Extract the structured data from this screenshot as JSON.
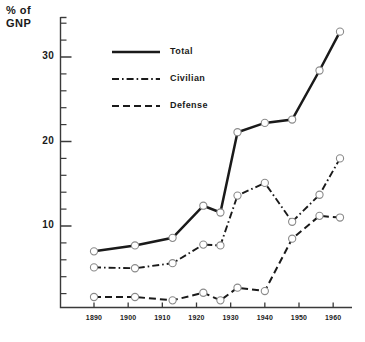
{
  "chart_data": {
    "type": "line",
    "title": "",
    "xlabel": "",
    "ylabel": "% of\nGNP",
    "ylabel_line1": "% of",
    "ylabel_line2": "GNP",
    "x": [
      1890,
      1902,
      1913,
      1922,
      1927,
      1932,
      1940,
      1948,
      1956,
      1962
    ],
    "xtick_labels": [
      "1890",
      "1900",
      "1910",
      "1920",
      "1930",
      "1940",
      "1950",
      "1960"
    ],
    "xtick_values": [
      1890,
      1900,
      1910,
      1920,
      1930,
      1940,
      1950,
      1960
    ],
    "ytick_labels": [
      "10",
      "20",
      "30"
    ],
    "ytick_values": [
      10,
      20,
      30
    ],
    "yminor_step": 2,
    "xlim": [
      1884,
      1966
    ],
    "ylim": [
      0,
      34.5
    ],
    "grid": false,
    "legend_position": "upper-left-inside",
    "marker": "open-circle",
    "series": [
      {
        "name": "Total",
        "style": "solid",
        "values": [
          7.0,
          7.7,
          8.6,
          12.4,
          11.6,
          21.1,
          22.2,
          22.6,
          28.4,
          33.0
        ]
      },
      {
        "name": "Civilian",
        "style": "dash-dot",
        "values": [
          5.1,
          5.0,
          5.6,
          7.8,
          7.7,
          13.6,
          15.1,
          10.5,
          13.7,
          18.0
        ]
      },
      {
        "name": "Defense",
        "style": "dashed",
        "values": [
          1.6,
          1.6,
          1.2,
          2.1,
          1.2,
          2.7,
          2.3,
          8.5,
          11.2,
          11.0
        ]
      }
    ]
  },
  "legend": {
    "items": [
      {
        "label": "Total",
        "style": "solid"
      },
      {
        "label": "Civilian",
        "style": "dash-dot"
      },
      {
        "label": "Defense",
        "style": "dashed"
      }
    ]
  },
  "colors": {
    "line": "#1a1a1a",
    "marker_fill": "#ffffff",
    "marker_stroke": "#8a8a8a",
    "axis": "#3a3a3a",
    "background": "#ffffff"
  }
}
